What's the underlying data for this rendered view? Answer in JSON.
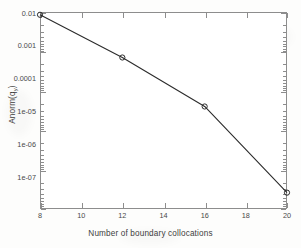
{
  "figure": {
    "background_color": "#ffffff",
    "frame_color": "#8d8d8d",
    "line_color": "#2b2b2b",
    "marker_color": "#2b2b2b"
  },
  "chart_data": {
    "type": "line",
    "title": "",
    "subtitle": "",
    "xlabel": "Number of boundary collocations",
    "ylabel": "Anorm(q",
    "ylabel_sub": "y",
    "ylabel_suffix": ")",
    "x": [
      8,
      12,
      16,
      20
    ],
    "y": [
      0.0085,
      0.0007,
      4e-05,
      2.6e-07
    ],
    "series": [
      {
        "name": "Anorm(q_y)",
        "x": [
          8,
          12,
          16,
          20
        ],
        "values": [
          0.0085,
          0.0007,
          4e-05,
          2.6e-07
        ]
      }
    ],
    "xscale": "linear",
    "yscale": "log",
    "xlim": [
      8,
      20
    ],
    "ylim": [
      1e-07,
      0.01
    ],
    "xticks": [
      8,
      10,
      12,
      14,
      16,
      18,
      20
    ],
    "xticklabels": [
      "8",
      "10",
      "12",
      "14",
      "16",
      "18",
      "20"
    ],
    "yticks": [
      0.01,
      0.001,
      0.0001,
      1e-05,
      1e-06,
      1e-07
    ],
    "yticklabels": [
      "0.01",
      "0.001",
      "0.0001",
      "1e-05",
      "1e-06",
      "1e-07"
    ],
    "grid": false,
    "legend": null,
    "legend_position": "none",
    "marker": "circle",
    "annotations": []
  }
}
